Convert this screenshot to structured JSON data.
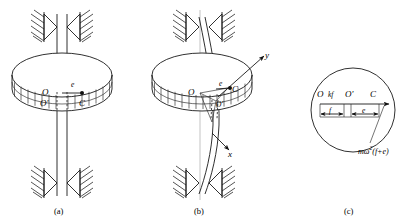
{
  "figure": {
    "panels": [
      {
        "id": "a",
        "caption": "(a)",
        "description": "Straight vertical shaft in two bearings carrying a disk; geometric center O coincides with bearing axis O', mass center C offset by eccentricity",
        "labels": {
          "center_geometric": "O",
          "center_shaft": "O'",
          "eccentricity": "e",
          "mass_center": "C"
        }
      },
      {
        "id": "b",
        "caption": "(b)",
        "description": "Shaft bowed by rotation; disk center O' displaced from bearing axis O, mass center C further offset; rotating x-y axes shown",
        "labels": {
          "bearing_axis": "O",
          "disk_center": "O'",
          "eccentricity": "e",
          "mass_center": "C",
          "axis_x": "x",
          "axis_y": "y"
        }
      },
      {
        "id": "c",
        "caption": "(c)",
        "description": "Free-body detail of the disk showing elastic restoring force kf and centrifugal force along the line O-O'-C",
        "labels": {
          "bearing_axis": "O",
          "restoring_force": "kf",
          "disk_center": "O'",
          "mass_center": "C",
          "dim_deflection": "f",
          "dim_eccentricity": "e",
          "centrifugal_force": "mω²(f+e)"
        },
        "formula_parts": {
          "mass_omega": "mω",
          "exponent": "2",
          "bracket": "(f+e)"
        }
      }
    ]
  },
  "colors": {
    "ink": "#1a1a1a",
    "ink_light": "#2a2a2a",
    "axis_gray": "#9a9a9a",
    "background": "#ffffff"
  }
}
